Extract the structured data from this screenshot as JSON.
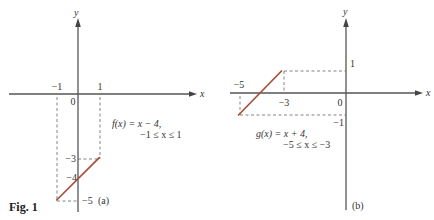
{
  "figure_label": "Fig. 1",
  "colors": {
    "segment": "#a5503a",
    "axis": "#555555"
  },
  "chart_data": [
    {
      "type": "line",
      "panel": "(a)",
      "function": "f(x) = x − 4,",
      "domain": "−1 ≤ x ≤ 1",
      "xlabel": "x",
      "ylabel": "y",
      "x": [
        -1,
        1
      ],
      "y": [
        -5,
        -3
      ],
      "x_tick_labels": [
        "−1",
        "0",
        "1"
      ],
      "y_tick_labels": [
        "−3",
        "−4",
        "−5"
      ],
      "annotations": [
        "dashed guides from x = −1 and x = 1 to the segment endpoints",
        "y-intercept at −4"
      ],
      "grid": false
    },
    {
      "type": "line",
      "panel": "(b)",
      "function": "g(x) = x + 4,",
      "domain": "−5 ≤ x ≤ −3",
      "xlabel": "x",
      "ylabel": "y",
      "x": [
        -5,
        -3
      ],
      "y": [
        -1,
        1
      ],
      "x_tick_labels": [
        "−5",
        "−3",
        "0"
      ],
      "y_tick_labels": [
        "1",
        "−1"
      ],
      "annotations": [
        "dashed guides from x = −5 and x = −3 to the segment endpoints",
        "x-intercept at −4"
      ],
      "grid": false
    }
  ],
  "panels": {
    "a": {
      "label": "(a)",
      "axis_x": "x",
      "axis_y": "y",
      "tick_neg1": "−1",
      "tick_1": "1",
      "origin": "0",
      "tick_y_neg3": "−3",
      "tick_y_neg4": "−4",
      "tick_y_neg5": "−5",
      "formula": "f(x) = x − 4,",
      "domain": "−1 ≤ x ≤ 1"
    },
    "b": {
      "label": "(b)",
      "axis_x": "x",
      "axis_y": "y",
      "tick_neg5": "−5",
      "tick_neg3": "−3",
      "origin": "0",
      "tick_y_1": "1",
      "tick_y_neg1": "−1",
      "formula": "g(x) = x + 4,",
      "domain": "−5 ≤ x ≤ −3"
    }
  }
}
